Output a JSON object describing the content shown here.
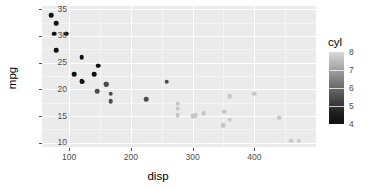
{
  "chart_data": {
    "type": "scatter",
    "title": "",
    "xlabel": "disp",
    "ylabel": "mpg",
    "xlim": [
      56,
      500
    ],
    "ylim": [
      9.2,
      35.6
    ],
    "xticks": [
      100,
      200,
      300,
      400
    ],
    "xtick_labels": [
      "100",
      "200",
      "300",
      "400"
    ],
    "yticks": [
      10,
      15,
      20,
      25,
      30,
      35
    ],
    "ytick_labels": [
      "10",
      "15",
      "20",
      "25",
      "30",
      "35"
    ],
    "x_minor_ticks": [
      150,
      250,
      350,
      450
    ],
    "y_minor_ticks": [
      12.5,
      17.5,
      22.5,
      27.5,
      32.5
    ],
    "grid": true,
    "panel_background": "#ebebeb",
    "gridline_color": "#ffffff",
    "legend": {
      "position": "right",
      "type": "continuous-colorbar",
      "title": "cyl",
      "ticks": [
        8,
        7,
        6,
        5,
        4
      ],
      "tick_labels": [
        "8",
        "7",
        "6",
        "5",
        "4"
      ],
      "range": [
        4,
        8
      ],
      "high_color": "#dcdcdc",
      "low_color": "#101010"
    },
    "color_variable": "cyl",
    "points": [
      {
        "x": 160,
        "y": 21.0,
        "cyl": 6,
        "color": "#4d4d4d"
      },
      {
        "x": 160,
        "y": 21.0,
        "cyl": 6,
        "color": "#4d4d4d"
      },
      {
        "x": 108,
        "y": 22.8,
        "cyl": 4,
        "color": "#101010"
      },
      {
        "x": 258,
        "y": 21.4,
        "cyl": 6,
        "color": "#4d4d4d"
      },
      {
        "x": 360,
        "y": 18.7,
        "cyl": 8,
        "color": "#c7c7c7"
      },
      {
        "x": 225,
        "y": 18.1,
        "cyl": 6,
        "color": "#4d4d4d"
      },
      {
        "x": 360,
        "y": 14.3,
        "cyl": 8,
        "color": "#c7c7c7"
      },
      {
        "x": 146.7,
        "y": 24.4,
        "cyl": 4,
        "color": "#101010"
      },
      {
        "x": 140.8,
        "y": 22.8,
        "cyl": 4,
        "color": "#101010"
      },
      {
        "x": 167.6,
        "y": 19.2,
        "cyl": 6,
        "color": "#4d4d4d"
      },
      {
        "x": 167.6,
        "y": 17.8,
        "cyl": 6,
        "color": "#4d4d4d"
      },
      {
        "x": 275.8,
        "y": 16.4,
        "cyl": 8,
        "color": "#c7c7c7"
      },
      {
        "x": 275.8,
        "y": 17.3,
        "cyl": 8,
        "color": "#c7c7c7"
      },
      {
        "x": 275.8,
        "y": 15.2,
        "cyl": 8,
        "color": "#c7c7c7"
      },
      {
        "x": 472,
        "y": 10.4,
        "cyl": 8,
        "color": "#c7c7c7"
      },
      {
        "x": 460,
        "y": 10.4,
        "cyl": 8,
        "color": "#c7c7c7"
      },
      {
        "x": 440,
        "y": 14.7,
        "cyl": 8,
        "color": "#c7c7c7"
      },
      {
        "x": 78.7,
        "y": 32.4,
        "cyl": 4,
        "color": "#101010"
      },
      {
        "x": 75.7,
        "y": 30.4,
        "cyl": 4,
        "color": "#101010"
      },
      {
        "x": 71.1,
        "y": 33.9,
        "cyl": 4,
        "color": "#101010"
      },
      {
        "x": 120.1,
        "y": 21.5,
        "cyl": 4,
        "color": "#101010"
      },
      {
        "x": 318,
        "y": 15.5,
        "cyl": 8,
        "color": "#c7c7c7"
      },
      {
        "x": 304,
        "y": 15.2,
        "cyl": 8,
        "color": "#c7c7c7"
      },
      {
        "x": 350,
        "y": 13.3,
        "cyl": 8,
        "color": "#c7c7c7"
      },
      {
        "x": 400,
        "y": 19.2,
        "cyl": 8,
        "color": "#c7c7c7"
      },
      {
        "x": 79,
        "y": 27.3,
        "cyl": 4,
        "color": "#101010"
      },
      {
        "x": 120.3,
        "y": 26.0,
        "cyl": 4,
        "color": "#101010"
      },
      {
        "x": 95.1,
        "y": 30.4,
        "cyl": 4,
        "color": "#101010"
      },
      {
        "x": 351,
        "y": 15.8,
        "cyl": 8,
        "color": "#c7c7c7"
      },
      {
        "x": 145,
        "y": 19.7,
        "cyl": 6,
        "color": "#4d4d4d"
      },
      {
        "x": 301,
        "y": 15.0,
        "cyl": 8,
        "color": "#c7c7c7"
      },
      {
        "x": 121,
        "y": 21.4,
        "cyl": 4,
        "color": "#101010"
      }
    ]
  }
}
